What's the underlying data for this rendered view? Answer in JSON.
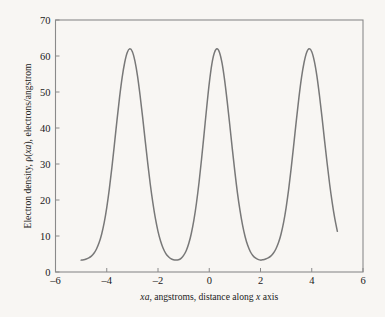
{
  "figure": {
    "background_color": "#f8f6f3",
    "frame_color": "#8a8a8a",
    "text_color": "#1a1a1a"
  },
  "chart_data": {
    "type": "line",
    "title": "",
    "subtitle": "",
    "xlabel_parts": {
      "sym_x": "x",
      "sym_a": "a",
      "text_mid": ", angstroms, distance along ",
      "sym_x2": "x",
      "text_end": " axis"
    },
    "xlabel": "xa, angstroms, distance along x axis",
    "ylabel_parts": {
      "text_start": "Electron density, ",
      "sym_rho": "ρ(",
      "sym_x": "x",
      "sym_a": "a",
      "sym_close": "),",
      "text_end": " electrons/angstrom"
    },
    "ylabel": "Electron density, ρ(xa), electrons/angstrom",
    "xlim": [
      -6,
      6
    ],
    "ylim": [
      0,
      70
    ],
    "xticks": [
      -6,
      -4,
      -2,
      0,
      2,
      4,
      6
    ],
    "xtick_labels": [
      "-6",
      "-4",
      "-2",
      "0",
      "2",
      "4",
      "6"
    ],
    "yticks": [
      0,
      10,
      20,
      30,
      40,
      50,
      60,
      70
    ],
    "ytick_labels": [
      "0",
      "10",
      "20",
      "30",
      "40",
      "50",
      "60",
      "70"
    ],
    "grid": false,
    "legend": null,
    "series": [
      {
        "name": "electron density",
        "color": "#787878",
        "line_width": 1.5,
        "peak_centers": [
          -3.35,
          0.0,
          3.35
        ],
        "peak_height": 62,
        "baseline": 3.3,
        "valley_centers": [
          -1.65,
          1.65
        ],
        "valley_value": 3.3,
        "x_range": [
          -5.0,
          5.0
        ],
        "x": [
          -5.0,
          -4.9,
          -4.8,
          -4.7,
          -4.6,
          -4.5,
          -4.4,
          -4.3,
          -4.2,
          -4.1,
          -4.0,
          -3.9,
          -3.8,
          -3.7,
          -3.6,
          -3.5,
          -3.4,
          -3.3,
          -3.2,
          -3.1,
          -3.0,
          -2.9,
          -2.8,
          -2.7,
          -2.6,
          -2.5,
          -2.4,
          -2.3,
          -2.2,
          -2.1,
          -2.0,
          -1.9,
          -1.8,
          -1.7,
          -1.6,
          -1.5,
          -1.4,
          -1.3,
          -1.2,
          -1.1,
          -1.0,
          -0.9,
          -0.8,
          -0.7,
          -0.6,
          -0.5,
          -0.4,
          -0.3,
          -0.2,
          -0.1,
          0.0,
          0.1,
          0.2,
          0.3,
          0.4,
          0.5,
          0.6,
          0.7,
          0.8,
          0.9,
          1.0,
          1.1,
          1.2,
          1.3,
          1.4,
          1.5,
          1.6,
          1.7,
          1.8,
          1.9,
          2.0,
          2.1,
          2.2,
          2.3,
          2.4,
          2.5,
          2.6,
          2.7,
          2.8,
          2.9,
          3.0,
          3.1,
          3.2,
          3.3,
          3.4,
          3.5,
          3.6,
          3.7,
          3.8,
          3.9,
          4.0,
          4.1,
          4.2,
          4.3,
          4.4,
          4.5,
          4.6,
          4.7,
          4.8,
          4.9,
          5.0
        ],
        "y": [
          3.3,
          3.4,
          3.6,
          3.9,
          4.4,
          5.2,
          6.4,
          8.1,
          10.5,
          13.7,
          17.9,
          23.0,
          29.0,
          35.5,
          42.2,
          48.5,
          54.0,
          58.2,
          61.0,
          62.0,
          61.2,
          58.6,
          54.5,
          49.1,
          43.0,
          36.5,
          30.2,
          24.3,
          19.2,
          14.8,
          11.3,
          8.6,
          6.6,
          5.2,
          4.3,
          3.7,
          3.4,
          3.3,
          3.4,
          3.8,
          4.6,
          5.9,
          7.9,
          10.7,
          14.4,
          19.1,
          24.8,
          31.4,
          38.5,
          45.7,
          52.4,
          57.7,
          60.9,
          62.0,
          61.0,
          58.0,
          53.3,
          47.4,
          40.9,
          34.2,
          27.8,
          22.0,
          17.1,
          13.0,
          9.8,
          7.4,
          5.7,
          4.6,
          3.9,
          3.5,
          3.3,
          3.4,
          3.6,
          3.9,
          4.4,
          5.2,
          6.4,
          8.1,
          10.5,
          13.7,
          17.9,
          23.0,
          29.0,
          35.5,
          42.2,
          48.5,
          54.0,
          58.2,
          61.0,
          62.0,
          61.2,
          58.6,
          54.5,
          49.1,
          43.0,
          36.5,
          30.2,
          24.3,
          19.2,
          14.8,
          11.3
        ]
      }
    ]
  }
}
